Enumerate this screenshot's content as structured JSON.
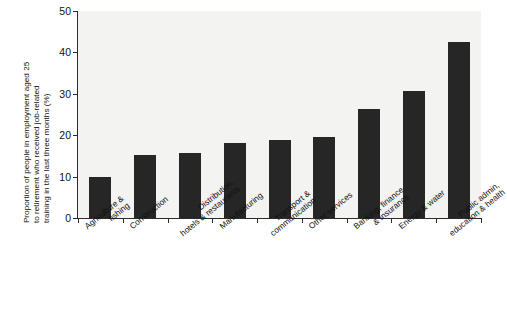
{
  "chart_data": {
    "type": "bar",
    "title": "",
    "xlabel": "",
    "ylabel": "Proportion of people in employment aged 25 to retirement who received job-related training in the last three months (%)",
    "ylabel_lines": [
      "Proportion of people in employment aged 25",
      "to retirement who received job-related",
      "training in the last three months (%)"
    ],
    "ylim": [
      0,
      50
    ],
    "yticks": [
      0,
      10,
      20,
      30,
      40,
      50
    ],
    "ytick_labels": [
      "0",
      "10",
      "20",
      "30",
      "40",
      "50"
    ],
    "grid": false,
    "legend": "none",
    "bar_color": "#262626",
    "panel_color": "#f3f3f1",
    "axis_color": "#2b2b2b",
    "categories": [
      "Agriculture & fishing",
      "Construction",
      "Distribution, hotels & restaurants",
      "Manufacturing",
      "Transport & communication",
      "Other services",
      "Banking, finance & insurance",
      "Energy & water",
      "Public admin, education & health"
    ],
    "category_lines": [
      [
        "Agriculture &",
        "fishing"
      ],
      [
        "Construction",
        ""
      ],
      [
        "Distribution,",
        "hotels & restaurants"
      ],
      [
        "Manufacturing",
        ""
      ],
      [
        "Transport &",
        "communication"
      ],
      [
        "Other services",
        ""
      ],
      [
        "Banking, finance",
        "& insurance"
      ],
      [
        "Energy & water",
        ""
      ],
      [
        "Public admin,",
        "education & health"
      ]
    ],
    "values": [
      10.0,
      15.2,
      15.7,
      18.2,
      18.8,
      19.6,
      26.4,
      30.8,
      42.4
    ]
  }
}
